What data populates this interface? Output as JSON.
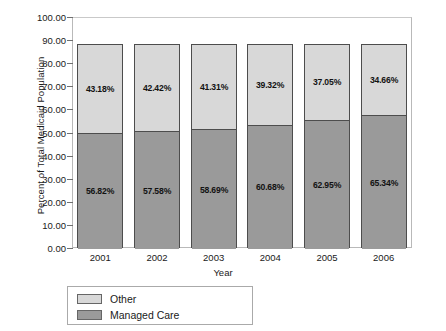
{
  "chart_data": {
    "type": "bar",
    "stacked": true,
    "title": "",
    "xlabel": "Year",
    "ylabel": "Percent of Total Medicaid Population",
    "categories": [
      "2001",
      "2002",
      "2003",
      "2004",
      "2005",
      "2006"
    ],
    "ylim": [
      0,
      100
    ],
    "ytick_labels": [
      "100.00",
      "90.00",
      "80.00",
      "70.00",
      "60.00",
      "50.00",
      "40.00",
      "30.00",
      "20.00",
      "10.00",
      "0.00"
    ],
    "ytick_values": [
      100,
      90,
      80,
      70,
      60,
      50,
      40,
      30,
      20,
      10,
      0
    ],
    "grid": false,
    "legend_position": "below-left",
    "bar_total_height": 88.5,
    "series": [
      {
        "name": "Managed Care",
        "color": "#9a9a9a",
        "values": [
          56.82,
          57.58,
          58.69,
          60.68,
          62.95,
          65.34
        ],
        "labels": [
          "56.82%",
          "57.58%",
          "58.69%",
          "60.68%",
          "62.95%",
          "65.34%"
        ],
        "plot_heights": [
          50.29,
          50.96,
          51.94,
          53.7,
          55.71,
          57.83
        ]
      },
      {
        "name": "Other",
        "color": "#d8d8d8",
        "values": [
          43.18,
          42.42,
          41.31,
          39.32,
          37.05,
          34.66
        ],
        "labels": [
          "43.18%",
          "42.42%",
          "41.31%",
          "39.32%",
          "37.05%",
          "34.66%"
        ],
        "plot_heights": [
          38.21,
          37.54,
          36.56,
          34.8,
          32.79,
          30.67
        ]
      }
    ]
  },
  "legend": {
    "items": [
      {
        "label": "Other",
        "color": "#d8d8d8"
      },
      {
        "label": "Managed Care",
        "color": "#9a9a9a"
      }
    ]
  }
}
